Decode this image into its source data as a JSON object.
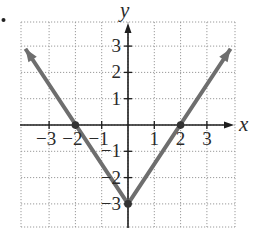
{
  "problem_marker": "•",
  "chart_data": {
    "type": "line",
    "title": "",
    "xlabel": "x",
    "ylabel": "y",
    "xlim": [
      -4,
      4
    ],
    "ylim": [
      -4,
      4
    ],
    "grid": true,
    "grid_style": "dotted",
    "x_ticks": [
      -3,
      -2,
      -1,
      1,
      2,
      3
    ],
    "y_ticks": [
      3,
      2,
      1,
      -1,
      -2,
      -3
    ],
    "x_tick_labels": [
      "−3",
      "−2",
      "−1",
      "1",
      "2",
      "3"
    ],
    "y_tick_labels": [
      "3",
      "2",
      "1",
      "−1",
      "−2",
      "−3"
    ],
    "series": [
      {
        "name": "V-shaped graph (y = 1.5|x| − 3)",
        "color": "#6e6e6e",
        "arrows_both_ends": true,
        "points": [
          {
            "x": -3.9,
            "y": 2.9
          },
          {
            "x": 0,
            "y": -3
          },
          {
            "x": 3.9,
            "y": 2.9
          }
        ]
      }
    ],
    "marked_points": [
      {
        "x": -2,
        "y": 0
      },
      {
        "x": 2,
        "y": 0
      },
      {
        "x": 0,
        "y": -3
      }
    ],
    "colors": {
      "axis": "#1e1e1e",
      "grid": "#9a9a9a",
      "curve": "#6e6e6e",
      "text": "#2a2a2a"
    }
  }
}
